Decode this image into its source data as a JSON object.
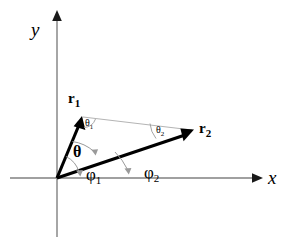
{
  "figure": {
    "type": "vector-angle-diagram",
    "background_color": "#ffffff",
    "axis_color": "#808080",
    "vector_color": "#000000",
    "helper_line_color": "#b0b0b0",
    "arc_color": "#9a9a9a",
    "axes": {
      "x_label": "x",
      "y_label": "y",
      "origin": [
        57,
        178
      ]
    },
    "vectors": [
      {
        "name": "r1",
        "label": "r",
        "subscript": "1",
        "tip": [
          82,
          117
        ],
        "tail": [
          57,
          178
        ]
      },
      {
        "name": "r2",
        "label": "r",
        "subscript": "2",
        "tip": [
          193,
          130
        ],
        "tail": [
          57,
          178
        ]
      }
    ],
    "angles": [
      {
        "name": "theta",
        "label": "θ",
        "subscript": "",
        "description": "angle between r1 and r2",
        "text_pos": [
          80,
          152
        ]
      },
      {
        "name": "theta1",
        "label": "θ",
        "subscript": "1",
        "description": "angle at r1 tip between r1 and the helper line",
        "text_pos": [
          86,
          122
        ]
      },
      {
        "name": "theta2",
        "label": "θ",
        "subscript": "2",
        "description": "angle at r2 tip between helper line and r2",
        "text_pos": [
          158,
          129
        ]
      },
      {
        "name": "phi1",
        "label": "φ",
        "subscript": "1",
        "description": "angle of r1 from the x-axis",
        "text_pos": [
          88,
          172
        ]
      },
      {
        "name": "phi2",
        "label": "φ",
        "subscript": "2",
        "description": "angle of r2 from the x-axis",
        "text_pos": [
          146,
          170
        ]
      }
    ],
    "helper_line": {
      "name": "r1-tip-to-r2-tip",
      "from": [
        82,
        117
      ],
      "to": [
        193,
        130
      ]
    }
  }
}
